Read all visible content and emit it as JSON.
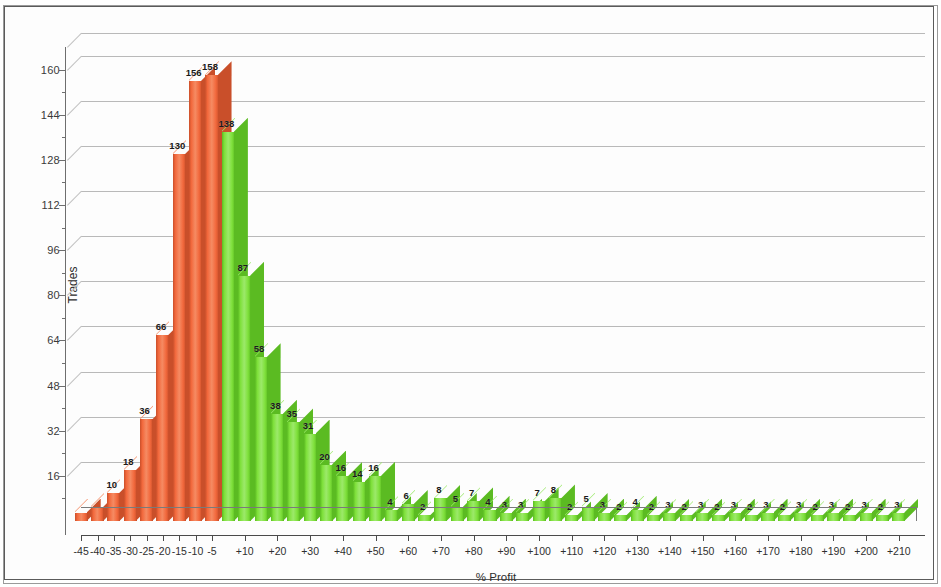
{
  "chart": {
    "type": "bar",
    "ylabel": "Trades",
    "xlabel": "% Profit",
    "title": ""
  },
  "axes": {
    "y_ticks": [
      "16",
      "32",
      "48",
      "64",
      "80",
      "96",
      "112",
      "128",
      "144",
      "160"
    ],
    "y_min": 0,
    "y_max": 168,
    "x_ticks": [
      "-45",
      "-40",
      "-35",
      "-30",
      "-25",
      "-20",
      "-15",
      "-10",
      "-5",
      "+10",
      "+20",
      "+30",
      "+40",
      "+50",
      "+60",
      "+70",
      "+80",
      "+90",
      "+100",
      "+110",
      "+120",
      "+130",
      "+140",
      "+150",
      "+160",
      "+170",
      "+180",
      "+190",
      "+200",
      "+210"
    ]
  },
  "colors": {
    "loss_bar": "#f2683c",
    "loss_bar_top": "#f58b63",
    "loss_bar_side": "#c94f2a",
    "profit_bar": "#7ee03a",
    "profit_bar_top": "#9ce96a",
    "profit_bar_side": "#5bbb22",
    "grid": "#c2c2c2",
    "axis": "#4a4a4a",
    "frame": "#5a5a5a",
    "text": "#2e2e2e"
  },
  "chart_data": {
    "type": "bar",
    "title": "",
    "xlabel": "% Profit",
    "ylabel": "Trades",
    "ylim": [
      0,
      168
    ],
    "grid": true,
    "legend": "none",
    "yticks": [
      16,
      32,
      48,
      64,
      80,
      96,
      112,
      128,
      144,
      160
    ],
    "xticks": [
      "-45",
      "-40",
      "-35",
      "-30",
      "-25",
      "-20",
      "-15",
      "-10",
      "-5",
      "+10",
      "+20",
      "+30",
      "+40",
      "+50",
      "+60",
      "+70",
      "+80",
      "+90",
      "+100",
      "+110",
      "+120",
      "+130",
      "+140",
      "+150",
      "+160",
      "+170",
      "+180",
      "+190",
      "+200",
      "+210"
    ],
    "categories": [
      "-45",
      "-40",
      "-35",
      "-30",
      "-25",
      "-20",
      "-15",
      "-10",
      "-5",
      "+5",
      "+10",
      "+15",
      "+20",
      "+25",
      "+30",
      "+35",
      "+40",
      "+45",
      "+50",
      "+55",
      "+60",
      "+65",
      "+70",
      "+75",
      "+80",
      "+85",
      "+90",
      "+95",
      "+100",
      "+105",
      "+110",
      "+115",
      "+120",
      "+125",
      "+130",
      "+135",
      "+140",
      "+145",
      "+150",
      "+155",
      "+160",
      "+165",
      "+170",
      "+175",
      "+180",
      "+185",
      "+190",
      "+195",
      "+200",
      "+205",
      "+210"
    ],
    "values": [
      3,
      5,
      10,
      18,
      36,
      66,
      130,
      156,
      158,
      138,
      87,
      58,
      38,
      35,
      31,
      20,
      16,
      14,
      16,
      4,
      6,
      2,
      8,
      5,
      7,
      4,
      3,
      3,
      7,
      8,
      2,
      5,
      3,
      2,
      4,
      2,
      3,
      2,
      3,
      2,
      3,
      2,
      3,
      2,
      3,
      2,
      3,
      2,
      3,
      2,
      3
    ],
    "labels": [
      "",
      "",
      "10",
      "18",
      "36",
      "66",
      "130",
      "156",
      "158",
      "138",
      "87",
      "58",
      "38",
      "35",
      "31",
      "20",
      "16",
      "14",
      "16",
      "4",
      "6",
      "2",
      "8",
      "5",
      "7",
      "4",
      "3",
      "3",
      "7",
      "8",
      "2",
      "5",
      "3",
      "2",
      "4",
      "2",
      "3",
      "2",
      "3",
      "2",
      "3",
      "2",
      "3",
      "2",
      "3",
      "2",
      "3",
      "2",
      "3",
      "2",
      "3"
    ],
    "series_colors": [
      "loss",
      "loss",
      "loss",
      "loss",
      "loss",
      "loss",
      "loss",
      "loss",
      "loss",
      "profit",
      "profit",
      "profit",
      "profit",
      "profit",
      "profit",
      "profit",
      "profit",
      "profit",
      "profit",
      "profit",
      "profit",
      "profit",
      "profit",
      "profit",
      "profit",
      "profit",
      "profit",
      "profit",
      "profit",
      "profit",
      "profit",
      "profit",
      "profit",
      "profit",
      "profit",
      "profit",
      "profit",
      "profit",
      "profit",
      "profit",
      "profit",
      "profit",
      "profit",
      "profit",
      "profit",
      "profit",
      "profit",
      "profit",
      "profit",
      "profit",
      "profit"
    ]
  }
}
